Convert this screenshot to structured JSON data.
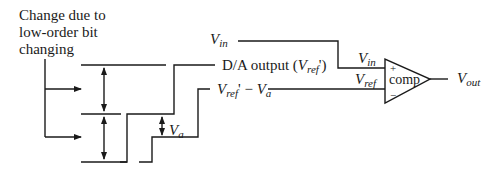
{
  "annotation": {
    "line1": "Change due to",
    "line2": "low-order bit",
    "line3": "changing"
  },
  "signals": {
    "vin_label": {
      "main": "V",
      "sub": "in"
    },
    "da_output_label": {
      "prefix": "D/A output (",
      "main": "V",
      "sub": "ref",
      "suffix": "')"
    },
    "diff_label": {
      "main1": "V",
      "sub1": "ref",
      "mid": "' − ",
      "main2": "V",
      "sub2": "a"
    },
    "va_label": {
      "main": "V",
      "sub": "a"
    }
  },
  "comparator": {
    "label": "comp",
    "plus": "+",
    "minus": "−",
    "in_plus_label": {
      "main": "V",
      "sub": "in"
    },
    "in_minus_label": {
      "main": "V",
      "sub": "ref"
    },
    "out_label": {
      "main": "V",
      "sub": "out"
    }
  },
  "colors": {
    "stroke": "#1a1a1a",
    "background": "#ffffff"
  }
}
